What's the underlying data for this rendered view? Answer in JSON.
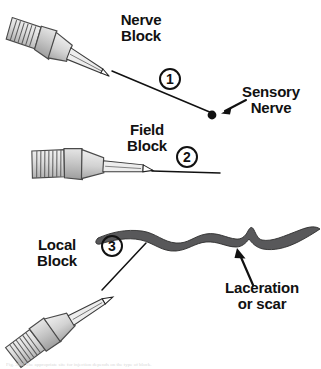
{
  "figure": {
    "background_color": "#ffffff",
    "ink_color": "#111111",
    "needle_body_color": "#d9d9d9",
    "needle_shade_color": "#b3b3b3",
    "laceration_color": "#58585a"
  },
  "techniques": [
    {
      "id": 1,
      "label": "Nerve\nBlock",
      "number": "1",
      "needle_orientation": "diagonal-down-right"
    },
    {
      "id": 2,
      "label": "Field\nBlock",
      "number": "2",
      "needle_orientation": "horizontal"
    },
    {
      "id": 3,
      "label": "Local\nBlock",
      "number": "3",
      "needle_orientation": "diagonal-up-right"
    }
  ],
  "annotations": {
    "sensory_nerve": {
      "label": "Sensory\nNerve",
      "marker": "filled-dot"
    },
    "laceration": {
      "label": "Laceration\nor scar",
      "marker": "arrow-up"
    }
  },
  "caption": {
    "text": "Fig. 30-3  The appropriate site for injection depends on the type of block."
  }
}
